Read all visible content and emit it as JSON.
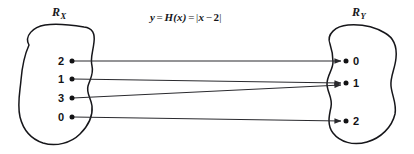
{
  "figure": {
    "type": "mapping-diagram",
    "width": 414,
    "height": 154,
    "background_color": "#ffffff",
    "ink_color": "#16161a",
    "formula": {
      "y": "y",
      "eq1": "=",
      "fn": "H(x)",
      "eq2": "=",
      "open_bar": "|",
      "expr_var": "x",
      "minus": "−",
      "expr_const": "2",
      "close_bar": "|",
      "plain": "y = H(x) = |x − 2|"
    },
    "domain_set": {
      "label_base": "R",
      "label_sub": "X",
      "label_plain": "R_X",
      "elements": [
        {
          "value": "2",
          "x": 70,
          "y": 61
        },
        {
          "value": "1",
          "x": 70,
          "y": 79
        },
        {
          "value": "3",
          "x": 70,
          "y": 98
        },
        {
          "value": "0",
          "x": 70,
          "y": 117
        }
      ]
    },
    "codomain_set": {
      "label_base": "R",
      "label_sub": "Y",
      "label_plain": "R_Y",
      "elements": [
        {
          "value": "0",
          "x": 345,
          "y": 61
        },
        {
          "value": "1",
          "x": 345,
          "y": 83
        },
        {
          "value": "2",
          "x": 345,
          "y": 121
        }
      ]
    },
    "mappings": [
      {
        "from": "2",
        "to": "0",
        "x1": 73,
        "y1": 61,
        "x2": 341,
        "y2": 61
      },
      {
        "from": "1",
        "to": "1",
        "x1": 73,
        "y1": 79,
        "x2": 341,
        "y2": 83
      },
      {
        "from": "3",
        "to": "1",
        "x1": 73,
        "y1": 98,
        "x2": 341,
        "y2": 84
      },
      {
        "from": "0",
        "to": "2",
        "x1": 73,
        "y1": 117,
        "x2": 341,
        "y2": 121
      }
    ]
  }
}
